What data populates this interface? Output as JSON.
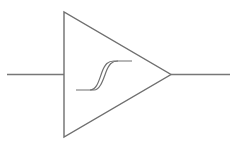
{
  "diagram": {
    "type": "schmitt-trigger-buffer",
    "stroke_color": "#777777",
    "background": "#ffffff",
    "components": [
      {
        "name": "input-line",
        "from": [
          7,
          74
        ],
        "to": [
          64,
          74
        ]
      },
      {
        "name": "triangle-body",
        "points": [
          [
            64,
            12
          ],
          [
            64,
            137
          ],
          [
            171,
            74
          ]
        ]
      },
      {
        "name": "output-line",
        "from": [
          171,
          74
        ],
        "to": [
          230,
          74
        ]
      },
      {
        "name": "hysteresis-symbol",
        "center": [
          104,
          76
        ]
      }
    ]
  }
}
